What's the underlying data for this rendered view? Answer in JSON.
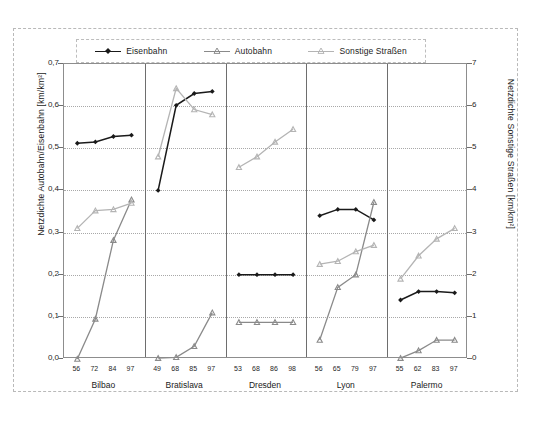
{
  "legend": {
    "position": "top",
    "items": [
      {
        "label": "Eisenbahn",
        "color": "#1a1a1a",
        "marker": "diamond"
      },
      {
        "label": "Autobahn",
        "color": "#8a8a8a",
        "marker": "triangle"
      },
      {
        "label": "Sonstige Straßen",
        "color": "#b4b4b4",
        "marker": "triangle"
      }
    ]
  },
  "axes": {
    "left_label": "Netzdichte Autobahn/Eisenbahn [km/km²]",
    "right_label": "Netzdichte Sonstige Straßen [km/km²]",
    "left_ticks": [
      "0,0",
      "0,1",
      "0,2",
      "0,3",
      "0,4",
      "0,5",
      "0,6",
      "0,7"
    ],
    "right_ticks": [
      "0",
      "1",
      "2",
      "3",
      "4",
      "5",
      "6",
      "7"
    ],
    "left_lim": [
      0.0,
      0.7
    ],
    "right_lim": [
      0,
      7
    ]
  },
  "chart_data": {
    "type": "line",
    "title": "",
    "xlabel": "",
    "ylabel": "Netzdichte Autobahn/Eisenbahn [km/km²]",
    "y2label": "Netzdichte Sonstige Straßen [km/km²]",
    "ylim": [
      0.0,
      0.7
    ],
    "y2lim": [
      0,
      7
    ],
    "grid": true,
    "legend_position": "top",
    "panels": [
      {
        "city": "Bilbao",
        "categories": [
          "56",
          "72",
          "84",
          "97"
        ],
        "series": [
          {
            "name": "Eisenbahn",
            "axis": "left",
            "values": [
              0.512,
              0.515,
              0.528,
              0.531
            ]
          },
          {
            "name": "Autobahn",
            "axis": "left",
            "values": [
              0.0,
              0.095,
              0.282,
              0.378
            ]
          },
          {
            "name": "Sonstige Straßen",
            "axis": "right",
            "values": [
              3.1,
              3.52,
              3.55,
              3.7
            ]
          }
        ]
      },
      {
        "city": "Bratislava",
        "categories": [
          "49",
          "68",
          "85",
          "97"
        ],
        "series": [
          {
            "name": "Eisenbahn",
            "axis": "left",
            "values": [
              0.4,
              0.602,
              0.63,
              0.635
            ]
          },
          {
            "name": "Autobahn",
            "axis": "left",
            "values": [
              0.002,
              0.004,
              0.03,
              0.11
            ]
          },
          {
            "name": "Sonstige Straßen",
            "axis": "right",
            "values": [
              4.8,
              6.42,
              5.92,
              5.8
            ]
          }
        ]
      },
      {
        "city": "Dresden",
        "categories": [
          "53",
          "68",
          "86",
          "98"
        ],
        "series": [
          {
            "name": "Eisenbahn",
            "axis": "left",
            "values": [
              0.2,
              0.2,
              0.2,
              0.2
            ]
          },
          {
            "name": "Autobahn",
            "axis": "left",
            "values": [
              0.087,
              0.087,
              0.087,
              0.087
            ]
          },
          {
            "name": "Sonstige Straßen",
            "axis": "right",
            "values": [
              4.55,
              4.8,
              5.15,
              5.45
            ]
          }
        ]
      },
      {
        "city": "Lyon",
        "categories": [
          "56",
          "65",
          "79",
          "97"
        ],
        "series": [
          {
            "name": "Eisenbahn",
            "axis": "left",
            "values": [
              0.34,
              0.355,
              0.355,
              0.33
            ]
          },
          {
            "name": "Autobahn",
            "axis": "left",
            "values": [
              0.045,
              0.17,
              0.2,
              0.372
            ]
          },
          {
            "name": "Sonstige Straßen",
            "axis": "right",
            "values": [
              2.25,
              2.32,
              2.55,
              2.7
            ]
          }
        ]
      },
      {
        "city": "Palermo",
        "categories": [
          "55",
          "62",
          "83",
          "97"
        ],
        "series": [
          {
            "name": "Eisenbahn",
            "axis": "left",
            "values": [
              0.14,
              0.16,
              0.16,
              0.157
            ]
          },
          {
            "name": "Autobahn",
            "axis": "left",
            "values": [
              0.002,
              0.02,
              0.045,
              0.045
            ]
          },
          {
            "name": "Sonstige Straßen",
            "axis": "right",
            "values": [
              1.9,
              2.45,
              2.85,
              3.1
            ]
          }
        ]
      }
    ]
  }
}
